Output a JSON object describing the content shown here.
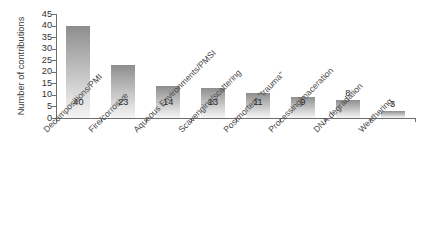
{
  "chart_data": {
    "type": "bar",
    "title": "",
    "xlabel": "",
    "ylabel": "Number of contributions",
    "ylim": [
      0,
      45
    ],
    "yticks": [
      0,
      5,
      10,
      15,
      20,
      25,
      30,
      35,
      40,
      45
    ],
    "grid": false,
    "legend": false,
    "bar_color": "#a8a8a8",
    "axis_color": "#6d6d6d",
    "categories": [
      "Decompositions/PMI",
      "Fire/corrosive",
      "Aqueous Environments/PMSI",
      "Scavenging/scattering",
      "Postmortem \"trauma\"",
      "Processing/maceration",
      "DNA degradation",
      "Weathering"
    ],
    "values": [
      40,
      23,
      14,
      13,
      11,
      9,
      8,
      3
    ],
    "value_labels": [
      "40",
      "23",
      "14",
      "13",
      "11",
      "9",
      "8",
      "3"
    ]
  }
}
